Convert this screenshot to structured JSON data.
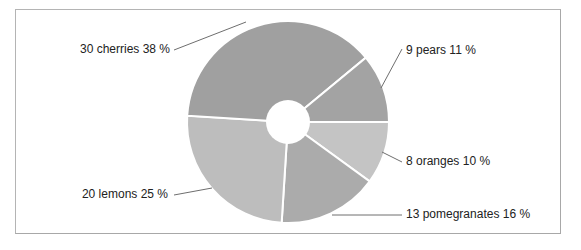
{
  "chart_data": {
    "type": "pie",
    "variant": "donut",
    "title": "",
    "unit": "%",
    "start_angle_deg": 0,
    "direction": "clockwise",
    "slices": [
      {
        "label": "oranges",
        "value": 8,
        "percent": 10,
        "color": "#c4c4c4",
        "text": "8 oranges 10 %"
      },
      {
        "label": "pomegranates",
        "value": 13,
        "percent": 16,
        "color": "#ababab",
        "text": "13 pomegranates 16 %"
      },
      {
        "label": "lemons",
        "value": 20,
        "percent": 25,
        "color": "#bdbdbd",
        "text": "20 lemons 25 %"
      },
      {
        "label": "cherries",
        "value": 30,
        "percent": 38,
        "color": "#a0a0a0",
        "text": "30 cherries 38 %"
      },
      {
        "label": "pears",
        "value": 9,
        "percent": 11,
        "color": "#a3a3a3",
        "text": "9 pears 11 %"
      }
    ],
    "categories": [
      "oranges",
      "pomegranates",
      "lemons",
      "cherries",
      "pears"
    ],
    "values": [
      8,
      13,
      20,
      30,
      9
    ],
    "percents": [
      10,
      16,
      25,
      38,
      11
    ],
    "legend": "none (inline leader-line labels)"
  },
  "labels": {
    "cherries": "30 cherries 38 %",
    "pears": "9 pears 11 %",
    "oranges": "8 oranges 10 %",
    "pomegranates": "13 pomegranates 16 %",
    "lemons": "20 lemons 25 %"
  },
  "layout": {
    "center": [
      288,
      122
    ],
    "outer_radius": 101,
    "inner_radius": 22,
    "label_positions": {
      "cherries": {
        "text_anchor": "end",
        "x": 170,
        "y": 50,
        "line": [
          [
            174,
            50
          ],
          [
            246,
            22
          ]
        ]
      },
      "pears": {
        "text_anchor": "start",
        "x": 406,
        "y": 51,
        "line": [
          [
            381,
            88
          ],
          [
            402,
            49
          ]
        ]
      },
      "oranges": {
        "text_anchor": "start",
        "x": 406,
        "y": 162,
        "line": [
          [
            382,
            152
          ],
          [
            402,
            162
          ]
        ]
      },
      "pomegranates": {
        "text_anchor": "start",
        "x": 406,
        "y": 215,
        "line": [
          [
            332,
            215
          ],
          [
            402,
            215
          ]
        ]
      },
      "lemons": {
        "text_anchor": "end",
        "x": 168,
        "y": 195,
        "line": [
          [
            174,
            195
          ],
          [
            212,
            188
          ]
        ]
      }
    }
  }
}
